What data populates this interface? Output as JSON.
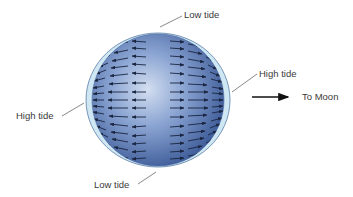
{
  "diagram": {
    "labels": {
      "top": "Low tide",
      "bottom": "Low tide",
      "left": "High tide",
      "right": "High tide",
      "direction": "To Moon"
    },
    "colors": {
      "sphere_light": "#c9d6ec",
      "sphere_mid": "#7f9bcc",
      "sphere_dark": "#3e5d9a",
      "ocean_bulge": "#cfe6f3",
      "ocean_outline": "#5a7fa8",
      "arrow": "#1a2540",
      "leader_line": "#555555"
    }
  }
}
